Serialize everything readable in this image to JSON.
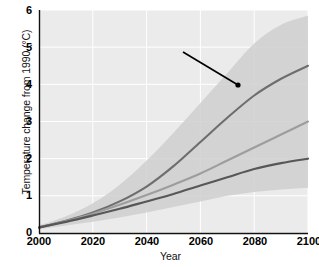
{
  "chart_data": {
    "type": "line",
    "title": "",
    "xlabel": "Year",
    "ylabel": "Temperature change from 1990 (°C)",
    "xlim": [
      2000,
      2100
    ],
    "ylim": [
      0,
      6
    ],
    "xticks": [
      "2000",
      "2020",
      "2040",
      "2060",
      "2080",
      "2100"
    ],
    "yticks": [
      "0",
      "1",
      "2",
      "3",
      "4",
      "5",
      "6"
    ],
    "grid": true,
    "legend": "none",
    "x": [
      2000,
      2010,
      2020,
      2030,
      2040,
      2050,
      2060,
      2070,
      2080,
      2090,
      2100
    ],
    "series": [
      {
        "name": "high-scenario",
        "color": "#6e6e6e",
        "values": [
          0.15,
          0.33,
          0.55,
          0.85,
          1.25,
          1.8,
          2.45,
          3.1,
          3.7,
          4.15,
          4.5
        ]
      },
      {
        "name": "mid-scenario",
        "color": "#9d9d9d",
        "values": [
          0.15,
          0.32,
          0.52,
          0.76,
          1.02,
          1.3,
          1.6,
          1.95,
          2.3,
          2.65,
          3.0
        ]
      },
      {
        "name": "low-scenario",
        "color": "#575757",
        "values": [
          0.15,
          0.3,
          0.47,
          0.65,
          0.85,
          1.05,
          1.28,
          1.5,
          1.72,
          1.88,
          2.0
        ]
      }
    ],
    "uncertainty_band": {
      "name": "uncertainty-shading",
      "color": "#cfcfcf",
      "upper": [
        0.2,
        0.45,
        0.8,
        1.3,
        1.95,
        2.7,
        3.5,
        4.3,
        5.1,
        5.6,
        5.85
      ],
      "lower": [
        0.1,
        0.2,
        0.3,
        0.42,
        0.55,
        0.7,
        0.85,
        1.0,
        1.1,
        1.17,
        1.22
      ]
    },
    "annotations": [
      {
        "marker": "3",
        "text": "Shading shows the uncertainty owing to incomplete knowledge of the climate system.",
        "arrow_from": [
          183,
          52
        ],
        "arrow_to": [
          238,
          85
        ]
      }
    ]
  },
  "colors": {
    "plot_background": "#ebebeb",
    "grid": "#ffffff",
    "axis": "#111111",
    "band": "#cfcfcf",
    "marker": "#8c8c8c"
  }
}
